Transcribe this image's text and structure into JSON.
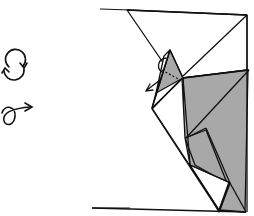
{
  "diagram": {
    "type": "origami-fold-step",
    "symbols": [
      {
        "name": "turn-over-symbol",
        "description": "circular arrows"
      },
      {
        "name": "twist-fold-symbol",
        "description": "loop with arrow"
      }
    ],
    "colors": {
      "paper_front": "#ffffff",
      "paper_back": "#a8a8a8",
      "line": "#111111"
    }
  }
}
